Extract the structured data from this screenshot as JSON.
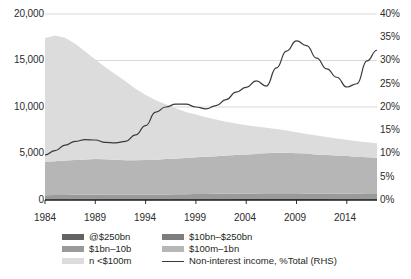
{
  "chart_data": {
    "type": "area",
    "title": "",
    "subtitle": "",
    "xlabel": "",
    "ylabel": "",
    "y2label": "",
    "xlim": [
      1984,
      2017
    ],
    "ylim": [
      0,
      20000
    ],
    "y2lim": [
      0,
      40
    ],
    "grid": true,
    "legend_position": "bottom",
    "x_ticks": [
      "1984",
      "1989",
      "1994",
      "1999",
      "2004",
      "2009",
      "2014"
    ],
    "x_tick_values": [
      1984,
      1989,
      1994,
      1999,
      2004,
      2009,
      2014
    ],
    "y_ticks": [
      "0",
      "5,000",
      "10,000",
      "15,000",
      "20,000"
    ],
    "y_tick_values": [
      0,
      5000,
      10000,
      15000,
      20000
    ],
    "y2_ticks": [
      "0%",
      "5%",
      "10%",
      "15%",
      "20%",
      "25%",
      "30%",
      "35%",
      "40%"
    ],
    "y2_tick_values": [
      0,
      5,
      10,
      15,
      20,
      25,
      30,
      35,
      40
    ],
    "x": [
      1984,
      1985,
      1986,
      1987,
      1988,
      1989,
      1990,
      1991,
      1992,
      1993,
      1994,
      1995,
      1996,
      1997,
      1998,
      1999,
      2000,
      2001,
      2002,
      2003,
      2004,
      2005,
      2006,
      2007,
      2008,
      2009,
      2010,
      2011,
      2012,
      2013,
      2014,
      2015,
      2016,
      2017
    ],
    "series": [
      {
        "name": "n <$100m",
        "color": "#dcdcdc",
        "values": [
          13300,
          13500,
          13200,
          12500,
          11600,
          10700,
          9900,
          9200,
          8500,
          7700,
          7000,
          6400,
          5900,
          5400,
          4950,
          4600,
          4250,
          3950,
          3650,
          3400,
          3150,
          2950,
          2750,
          2550,
          2400,
          2250,
          2150,
          2050,
          1950,
          1850,
          1750,
          1650,
          1600,
          1550
        ]
      },
      {
        "name": "$100m–1bn",
        "color": "#b6b6b6",
        "values": [
          3600,
          3650,
          3700,
          3750,
          3800,
          3820,
          3800,
          3750,
          3700,
          3700,
          3720,
          3750,
          3800,
          3850,
          3900,
          3950,
          4000,
          4050,
          4100,
          4150,
          4200,
          4250,
          4300,
          4350,
          4350,
          4300,
          4250,
          4200,
          4150,
          4100,
          4050,
          4000,
          3950,
          3900
        ]
      },
      {
        "name": "$1bn–10b",
        "color": "#9a9a9a",
        "values": [
          460,
          470,
          480,
          490,
          500,
          510,
          510,
          505,
          500,
          500,
          505,
          510,
          520,
          530,
          540,
          550,
          560,
          570,
          580,
          590,
          600,
          610,
          620,
          630,
          630,
          620,
          610,
          600,
          590,
          580,
          575,
          570,
          565,
          560
        ]
      },
      {
        "name": "$10bn–$250bn",
        "color": "#7d7d7d",
        "values": [
          55,
          56,
          58,
          60,
          62,
          64,
          65,
          66,
          67,
          68,
          70,
          72,
          74,
          76,
          78,
          80,
          82,
          84,
          86,
          88,
          90,
          92,
          94,
          96,
          96,
          94,
          92,
          90,
          88,
          86,
          85,
          84,
          83,
          82
        ]
      },
      {
        "name": "@$250bn",
        "color": "#636363",
        "values": [
          2,
          2,
          2,
          2,
          2,
          3,
          3,
          3,
          3,
          4,
          4,
          4,
          5,
          5,
          5,
          6,
          6,
          6,
          6,
          7,
          7,
          7,
          8,
          8,
          8,
          8,
          8,
          8,
          8,
          8,
          8,
          8,
          8,
          8
        ]
      }
    ],
    "line_series": {
      "name": "Non-interest income, %Total (RHS)",
      "color": "#3a3a3a",
      "axis": "right",
      "unit": "%",
      "values": [
        9.7,
        10.6,
        11.8,
        12.6,
        13.0,
        12.9,
        12.4,
        12.3,
        12.6,
        14.0,
        16.0,
        18.9,
        20.0,
        20.6,
        20.6,
        20.0,
        19.6,
        20.3,
        21.6,
        23.2,
        24.2,
        25.6,
        24.5,
        28.4,
        32.0,
        34.2,
        33.2,
        30.5,
        28.2,
        26.4,
        24.3,
        25.0,
        29.9,
        32.2
      ]
    }
  },
  "legend": {
    "items": [
      {
        "label": "@$250bn",
        "color": "#636363",
        "type": "swatch"
      },
      {
        "label": "$10bn–$250bn",
        "color": "#7d7d7d",
        "type": "swatch"
      },
      {
        "label": "$1bn–10b",
        "color": "#9a9a9a",
        "type": "swatch"
      },
      {
        "label": "$100m–1bn",
        "color": "#b6b6b6",
        "type": "swatch"
      },
      {
        "label": "n <$100m",
        "color": "#dcdcdc",
        "type": "swatch"
      },
      {
        "label": "Non-interest income, %Total (RHS)",
        "color": "#3a3a3a",
        "type": "line"
      }
    ]
  },
  "axes": {
    "left_ticks": [
      "20,000",
      "15,000",
      "10,000",
      "5,000",
      "0"
    ],
    "right_ticks": [
      "40%",
      "35%",
      "30%",
      "25%",
      "20%",
      "15%",
      "10%",
      "5%",
      "0%"
    ],
    "x_ticks": [
      "1984",
      "1989",
      "1994",
      "1999",
      "2004",
      "2009",
      "2014"
    ]
  }
}
